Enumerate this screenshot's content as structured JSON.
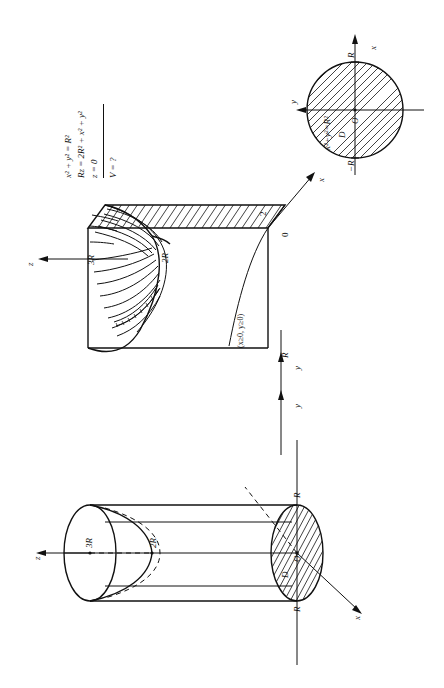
{
  "figure": {
    "title_semantics": "solid-of-revolution-volume-problem",
    "orientation_note": "page-rotated-90-ccw"
  },
  "given": {
    "line1": "x² + y² = R²",
    "line2": "Rz = 2R² + x² + y²",
    "line3": "z = 0",
    "question": "V = ?"
  },
  "circle_diagram": {
    "equation": "x²+y²=R²",
    "axis_x": "x",
    "axis_y": "y",
    "origin": "O",
    "region": "D",
    "tick_pos": "R",
    "tick_neg": "−R"
  },
  "middle_diagram": {
    "axis_z": "z",
    "axis_x": "x",
    "label_3R": "3R",
    "label_2R": "2R",
    "label_0": "0",
    "label_R": "R",
    "label_2": "2",
    "condition": "(x≥0, y≥0)"
  },
  "cylinder_diagram": {
    "axis_z": "z",
    "axis_x": "x",
    "axis_y": "y",
    "label_3R": "3R",
    "label_2R": "2R",
    "origin": "O",
    "region": "D",
    "label_R_top": "R",
    "label_R_bottom": "R"
  },
  "axes_between": {
    "y_upper": "y",
    "y_lower": "y"
  },
  "colors": {
    "ink": "#111111",
    "paper": "#ffffff"
  }
}
